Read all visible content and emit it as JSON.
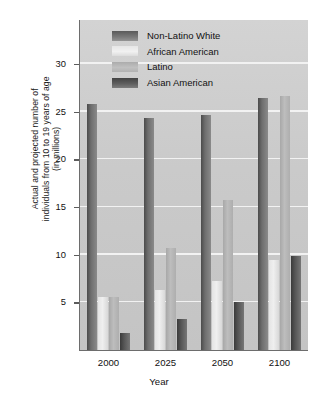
{
  "chart_data": {
    "type": "bar",
    "title": "",
    "categories": [
      "2000",
      "2025",
      "2050",
      "2100"
    ],
    "series": [
      {
        "name": "Non-Latino White",
        "values": [
          25.8,
          24.3,
          24.6,
          26.4
        ],
        "color": "#6e6e6e"
      },
      {
        "name": "African American",
        "values": [
          5.6,
          6.3,
          7.2,
          9.4
        ],
        "color": "#ebebeb"
      },
      {
        "name": "Latino",
        "values": [
          5.6,
          10.7,
          15.7,
          26.6
        ],
        "color": "#b9b9b9"
      },
      {
        "name": "Asian American",
        "values": [
          1.8,
          3.3,
          5.0,
          9.9
        ],
        "color": "#555555"
      }
    ],
    "xlabel": "Year",
    "ylabel": "Actual and projected number of\nindividuals from 10 to 19 years of age\n(in millions)",
    "yticks": [
      5,
      10,
      15,
      20,
      25,
      30
    ],
    "ylim": [
      0,
      34.6
    ],
    "grid": true,
    "legend_position": "top-left-inside"
  },
  "legend": {
    "entries": [
      {
        "label": "Non-Latino White"
      },
      {
        "label": "African American"
      },
      {
        "label": "Latino"
      },
      {
        "label": "Asian American"
      }
    ]
  },
  "axes": {
    "x_tick_labels": [
      "2000",
      "2025",
      "2050",
      "2100"
    ],
    "y_tick_labels": [
      "5",
      "10",
      "15",
      "20",
      "25",
      "30"
    ],
    "x_title": "Year",
    "y_title": "Actual and projected number of\nindividuals from 10 to 19 years of age\n(in millions)"
  }
}
